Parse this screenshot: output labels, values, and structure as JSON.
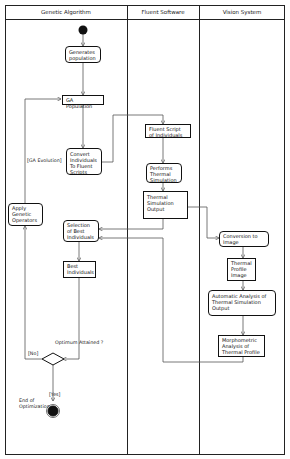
{
  "diagram": {
    "type": "uml-activity-swimlane",
    "lanes": [
      {
        "label": "Genetic Algorithm"
      },
      {
        "label": "Fluent Software"
      },
      {
        "label": "Vision System"
      }
    ],
    "nodes": {
      "generates_population": "Generates population",
      "ga_population": "GA Population",
      "convert_individuals": "Convert Individuals To Fluent Scripts",
      "fluent_script": "Fluent Script of Individuals",
      "performs_thermal": "Performs Thermal Simulation",
      "thermal_output": "Thermal Simulation Output",
      "conversion_image": "Conversion to Image",
      "thermal_profile_image": "Thermal Profile Image",
      "automatic_analysis": "Automatic Analysis of Thermal Simulation Output",
      "morphometric_analysis": "Morphometric Analysis of Thermal Profile",
      "selection_best": "Selection of Best Individuals",
      "best_individuals": "Best Individuals",
      "apply_genetic": "Apply Genetic Operators"
    },
    "labels": {
      "ga_evolution": "[GA Evolution]",
      "optimum_attained": "Optimum Attained ?",
      "no": "[No]",
      "yes": "[Yes]",
      "end": "End of Optimization"
    }
  }
}
